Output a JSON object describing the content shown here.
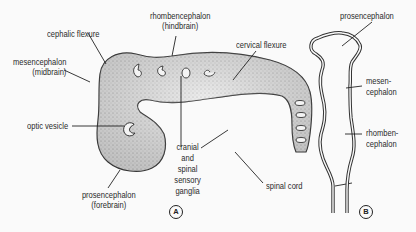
{
  "figure_a": {
    "panel_label": "A",
    "labels": {
      "cephalic_flexure": "cephalic flexure",
      "mesencephalon_1": "mesencephalon",
      "mesencephalon_2": "(midbrain)",
      "rhombencephalon_1": "rhombencephalon",
      "rhombencephalon_2": "(hindbrain)",
      "cervical_flexure": "cervical flexure",
      "optic_vesicle": "optic vesicle",
      "prosencephalon_1": "prosencephalon",
      "prosencephalon_2": "(forebrain)",
      "ganglia_1": "cranial",
      "ganglia_2": "and",
      "ganglia_3": "spinal",
      "ganglia_4": "sensory",
      "ganglia_5": "ganglia",
      "spinal_cord": "spinal cord"
    }
  },
  "figure_b": {
    "panel_label": "B",
    "labels": {
      "prosencephalon": "prosencephalon",
      "mesen_1": "mesen-",
      "mesen_2": "cephalon",
      "rhomben_1": "rhomben-",
      "rhomben_2": "cephalon"
    }
  }
}
